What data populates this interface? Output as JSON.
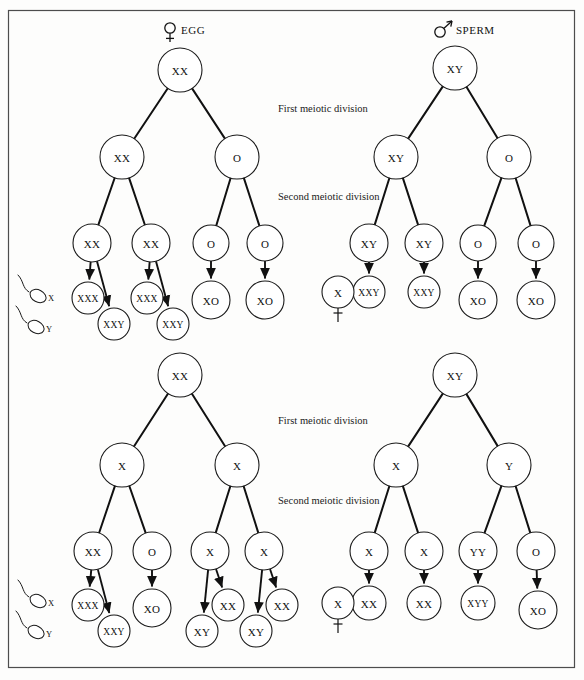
{
  "figure": {
    "frame_color": "#4d4d4d",
    "background": "#fdfdfc",
    "ink_color": "#111111"
  },
  "headers": {
    "egg": {
      "label": "EGG",
      "symbol": "female-symbol"
    },
    "sperm": {
      "label": "SPERM",
      "symbol": "male-symbol"
    }
  },
  "division_labels": {
    "first": "First meiotic division",
    "second": "Second meiotic division"
  },
  "legend": {
    "sperm_x": "X",
    "sperm_y": "Y"
  },
  "lethal_marker": {
    "label": "X",
    "dagger": "dagger-symbol"
  },
  "trees": [
    {
      "id": "egg-first-division-nondisjunction",
      "quadrant": "top-left",
      "gamete": "EGG",
      "root": {
        "label": "XX",
        "cx": 180,
        "cy": 70,
        "r": 22
      },
      "level2": [
        {
          "label": "XX",
          "cx": 122,
          "cy": 157,
          "r": 22
        },
        {
          "label": "O",
          "cx": 237,
          "cy": 157,
          "r": 22
        }
      ],
      "level3": [
        {
          "label": "XX",
          "cx": 92,
          "cy": 243,
          "r": 19
        },
        {
          "label": "XX",
          "cx": 151,
          "cy": 243,
          "r": 19
        },
        {
          "label": "O",
          "cx": 211,
          "cy": 243,
          "r": 18
        },
        {
          "label": "O",
          "cx": 265,
          "cy": 243,
          "r": 18
        }
      ],
      "products": [
        {
          "label": "XXX",
          "cx": 88,
          "cy": 298,
          "r": 16,
          "from": 0
        },
        {
          "label": "XXY",
          "cx": 114,
          "cy": 324,
          "r": 16,
          "from": 0
        },
        {
          "label": "XXX",
          "cx": 147,
          "cy": 298,
          "r": 16,
          "from": 1
        },
        {
          "label": "XXY",
          "cx": 173,
          "cy": 324,
          "r": 16,
          "from": 1
        },
        {
          "label": "XO",
          "cx": 211,
          "cy": 300,
          "r": 19,
          "from": 2
        },
        {
          "label": "XO",
          "cx": 265,
          "cy": 300,
          "r": 19,
          "from": 3
        }
      ]
    },
    {
      "id": "sperm-first-division-nondisjunction",
      "quadrant": "top-right",
      "gamete": "SPERM",
      "root": {
        "label": "XY",
        "cx": 455,
        "cy": 68,
        "r": 22
      },
      "level2": [
        {
          "label": "XY",
          "cx": 396,
          "cy": 157,
          "r": 22
        },
        {
          "label": "O",
          "cx": 509,
          "cy": 157,
          "r": 22
        }
      ],
      "level3": [
        {
          "label": "XY",
          "cx": 369,
          "cy": 243,
          "r": 19
        },
        {
          "label": "XY",
          "cx": 424,
          "cy": 243,
          "r": 19
        },
        {
          "label": "O",
          "cx": 478,
          "cy": 243,
          "r": 18
        },
        {
          "label": "O",
          "cx": 536,
          "cy": 243,
          "r": 18
        }
      ],
      "products": [
        {
          "label": "XXY",
          "cx": 369,
          "cy": 292,
          "r": 16,
          "from": 0
        },
        {
          "label": "XXY",
          "cx": 424,
          "cy": 292,
          "r": 16,
          "from": 1
        },
        {
          "label": "XO",
          "cx": 478,
          "cy": 300,
          "r": 19,
          "from": 2
        },
        {
          "label": "XO",
          "cx": 536,
          "cy": 300,
          "r": 19,
          "from": 3
        }
      ]
    },
    {
      "id": "egg-second-division-nondisjunction",
      "quadrant": "bottom-left",
      "gamete": "EGG",
      "root": {
        "label": "XX",
        "cx": 180,
        "cy": 375,
        "r": 22
      },
      "level2": [
        {
          "label": "X",
          "cx": 122,
          "cy": 465,
          "r": 22
        },
        {
          "label": "X",
          "cx": 237,
          "cy": 465,
          "r": 22
        }
      ],
      "level3": [
        {
          "label": "XX",
          "cx": 93,
          "cy": 551,
          "r": 19
        },
        {
          "label": "O",
          "cx": 152,
          "cy": 551,
          "r": 19
        },
        {
          "label": "X",
          "cx": 210,
          "cy": 551,
          "r": 19
        },
        {
          "label": "X",
          "cx": 264,
          "cy": 551,
          "r": 19
        }
      ],
      "products": [
        {
          "label": "XXX",
          "cx": 88,
          "cy": 605,
          "r": 16,
          "from": 0
        },
        {
          "label": "XXY",
          "cx": 114,
          "cy": 631,
          "r": 16,
          "from": 0
        },
        {
          "label": "XO",
          "cx": 152,
          "cy": 608,
          "r": 19,
          "from": 1
        },
        {
          "label": "XY",
          "cx": 202,
          "cy": 631,
          "r": 16,
          "from": 2
        },
        {
          "label": "XX",
          "cx": 228,
          "cy": 605,
          "r": 16,
          "from": 2
        },
        {
          "label": "XY",
          "cx": 256,
          "cy": 631,
          "r": 16,
          "from": 3
        },
        {
          "label": "XX",
          "cx": 282,
          "cy": 605,
          "r": 16,
          "from": 3
        }
      ]
    },
    {
      "id": "sperm-second-division-nondisjunction",
      "quadrant": "bottom-right",
      "gamete": "SPERM",
      "root": {
        "label": "XY",
        "cx": 455,
        "cy": 375,
        "r": 22
      },
      "level2": [
        {
          "label": "X",
          "cx": 396,
          "cy": 465,
          "r": 22
        },
        {
          "label": "Y",
          "cx": 509,
          "cy": 465,
          "r": 22
        }
      ],
      "level3": [
        {
          "label": "X",
          "cx": 369,
          "cy": 551,
          "r": 19
        },
        {
          "label": "X",
          "cx": 424,
          "cy": 551,
          "r": 19
        },
        {
          "label": "YY",
          "cx": 478,
          "cy": 551,
          "r": 19
        },
        {
          "label": "O",
          "cx": 536,
          "cy": 551,
          "r": 19
        }
      ],
      "products": [
        {
          "label": "XX",
          "cx": 369,
          "cy": 603,
          "r": 17,
          "from": 0
        },
        {
          "label": "XX",
          "cx": 424,
          "cy": 603,
          "r": 17,
          "from": 1
        },
        {
          "label": "XYY",
          "cx": 478,
          "cy": 603,
          "r": 17,
          "from": 2
        },
        {
          "label": "XO",
          "cx": 538,
          "cy": 610,
          "r": 19,
          "from": 3
        }
      ]
    }
  ],
  "lethal_nodes": [
    {
      "label": "X",
      "cx": 338,
      "cy": 292,
      "r": 16
    },
    {
      "label": "X",
      "cx": 338,
      "cy": 603,
      "r": 16
    }
  ],
  "label_positions": {
    "first_top": {
      "x": 278,
      "y": 110
    },
    "second_top": {
      "x": 278,
      "y": 198
    },
    "first_bottom": {
      "x": 278,
      "y": 422
    },
    "second_bottom": {
      "x": 278,
      "y": 502
    }
  }
}
